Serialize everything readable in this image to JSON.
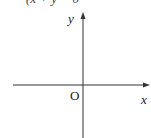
{
  "caption_partial": "(x + y = 0",
  "axes": {
    "x_label": "x",
    "y_label": "y",
    "origin_label": "O"
  }
}
